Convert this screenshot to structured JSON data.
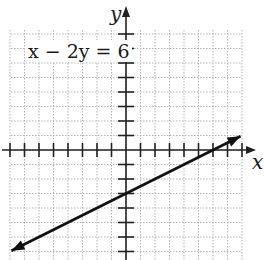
{
  "graph": {
    "equation_label": "x − 2y = 6",
    "x_axis_label": "x",
    "y_axis_label": "y",
    "origin_px": [
      126,
      150
    ],
    "unit_px": 14.5,
    "grid_bounds_px": {
      "left": 11,
      "top": 30,
      "right": 242,
      "bottom": 260
    },
    "colors": {
      "line": "#111111",
      "grid": "#b5b5b5",
      "axis": "#222222"
    }
  },
  "chart_data": {
    "type": "line",
    "title": "x − 2y = 6",
    "xlabel": "x",
    "ylabel": "y",
    "xlim": [
      -8,
      8
    ],
    "ylim": [
      -7.5,
      8
    ],
    "grid": true,
    "tick_spacing": 1,
    "series": [
      {
        "name": "x − 2y = 6",
        "slope": 0.5,
        "y_intercept": -3,
        "x_intercept": 6,
        "x": [
          -8,
          0,
          6,
          8
        ],
        "values": [
          -7,
          -3,
          0,
          1
        ],
        "arrows_both_ends": true
      }
    ]
  }
}
